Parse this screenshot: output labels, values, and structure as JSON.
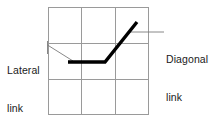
{
  "figure": {
    "type": "schematic-diagram",
    "background_color": "#ffffff",
    "grid": {
      "name": "3x3-cell-grid",
      "rows": 3,
      "columns": 3,
      "line_color": "#9a9a9a",
      "line_width": 1,
      "left": 48,
      "top": 7,
      "right": 148,
      "bottom": 115,
      "vertical_line_x": [
        48,
        81,
        115,
        148
      ],
      "horizontal_line_y": [
        7,
        43,
        79,
        115
      ]
    },
    "polyline": {
      "name": "brace-member-polyline",
      "color": "#000000",
      "line_width": 3.4,
      "points": [
        {
          "x": 68,
          "y": 62
        },
        {
          "x": 105,
          "y": 62
        },
        {
          "x": 137,
          "y": 22
        }
      ],
      "segments": [
        {
          "id": "lateral",
          "label_ref": "lateral",
          "from": {
            "x": 68,
            "y": 62
          },
          "to": {
            "x": 105,
            "y": 62
          }
        },
        {
          "id": "diagonal",
          "label_ref": "diagonal",
          "from": {
            "x": 105,
            "y": 62
          },
          "to": {
            "x": 137,
            "y": 22
          }
        }
      ]
    },
    "leaders": {
      "color": "#7a7a7a",
      "line_width": 0.9,
      "lateral": {
        "name": "lateral-leader",
        "tick": {
          "x": 47,
          "y1": 41,
          "y2": 54
        },
        "line": [
          {
            "x": 47,
            "y": 45
          },
          {
            "x": 73,
            "y": 61
          }
        ]
      },
      "diagonal": {
        "name": "diagonal-leader",
        "line": [
          {
            "x": 130,
            "y": 32
          },
          {
            "x": 164,
            "y": 32
          }
        ]
      }
    }
  },
  "labels": {
    "lateral": {
      "name": "lateral-link-label",
      "line1": "Lateral",
      "line2": "link",
      "color": "#1a1a1a",
      "align": "left"
    },
    "diagonal": {
      "name": "diagonal-link-label",
      "line1": "Diagonal",
      "line2": "link",
      "color": "#1a1a1a",
      "align": "left"
    }
  }
}
